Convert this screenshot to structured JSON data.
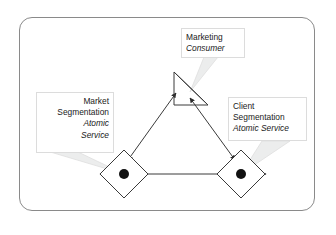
{
  "diagram": {
    "background_color": "#ffffff",
    "frame_color": "#8a8a8a",
    "stroke_color": "#333333",
    "leader_color": "#d5d5d5",
    "label_border_color": "#dcdcdc",
    "text_color": "#1a1a1a",
    "labels": {
      "marketing": {
        "line1": "Marketing",
        "line2": "Consumer"
      },
      "market_segmentation": {
        "line1": "Market",
        "line2": "Segmentation",
        "line3": "Atomic",
        "line4": "Service"
      },
      "client_segmentation": {
        "line1": "Client",
        "line2": "Segmentation",
        "line3": "Atomic Service"
      }
    },
    "nodes": [
      {
        "id": "marketing-consumer",
        "shape": "right-triangle",
        "center_x": 191,
        "center_y": 88
      },
      {
        "id": "market-segmentation-service",
        "shape": "diamond-with-dot",
        "center_x": 124,
        "center_y": 174
      },
      {
        "id": "client-segmentation-service",
        "shape": "diamond-with-dot",
        "center_x": 241,
        "center_y": 174
      }
    ],
    "connectors": [
      {
        "id": "market-to-marketing",
        "from": "market-segmentation-service",
        "to": "marketing-consumer",
        "arrowheads": "both"
      },
      {
        "id": "marketing-to-client",
        "from": "marketing-consumer",
        "to": "client-segmentation-service",
        "arrowheads": "both"
      },
      {
        "id": "market-to-client",
        "from": "market-segmentation-service",
        "to": "client-segmentation-service",
        "arrowheads": "both"
      }
    ]
  }
}
